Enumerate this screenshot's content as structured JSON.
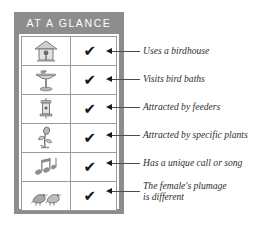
{
  "panel": {
    "title": "AT A GLANCE",
    "background_color": "#8d8d8d",
    "title_color": "#ffffff"
  },
  "table": {
    "border_color": "#9a9a9a",
    "check_glyph": "✔",
    "rows": [
      {
        "icon_name": "birdhouse-icon",
        "checked": true,
        "caption": "Uses a birdhouse"
      },
      {
        "icon_name": "bird-bath-icon",
        "checked": true,
        "caption": "Visits bird baths"
      },
      {
        "icon_name": "bird-feeder-icon",
        "checked": true,
        "caption": "Attracted by feeders"
      },
      {
        "icon_name": "flowering-plant-icon",
        "checked": true,
        "caption": "Attracted by specific plants"
      },
      {
        "icon_name": "music-notes-icon",
        "checked": true,
        "caption": "Has a unique call or song"
      },
      {
        "icon_name": "bird-pair-icon",
        "checked": true,
        "caption_line1": "The female's plumage",
        "caption_line2": "is different"
      }
    ]
  },
  "annotations": {
    "line_color": "#4a4a4a",
    "arrow_color": "#1b1b1b"
  }
}
